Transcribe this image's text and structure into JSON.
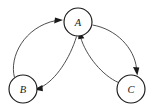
{
  "diagram": {
    "background_color": "#ffffff",
    "node_stroke_color": "#1a1a1a",
    "edge_stroke_color": "#3a3a3a",
    "label_color": "#1a1a1a",
    "nodes": [
      {
        "id": "A",
        "label": "A",
        "cx": 78,
        "cy": 22,
        "r": 14
      },
      {
        "id": "B",
        "label": "B",
        "cx": 23,
        "cy": 89,
        "r": 14
      },
      {
        "id": "C",
        "label": "C",
        "cx": 131,
        "cy": 89,
        "r": 14
      }
    ],
    "edges": [
      {
        "id": "B-to-A",
        "from": "B",
        "to": "A",
        "label": "",
        "shape": "outer-left-arc",
        "arrow_at": "A"
      },
      {
        "id": "A-to-B",
        "from": "A",
        "to": "B",
        "label": "",
        "shape": "inner-left-arc",
        "arrow_at": "B"
      },
      {
        "id": "A-to-C",
        "from": "A",
        "to": "C",
        "label": "",
        "shape": "outer-right-arc",
        "arrow_at": "C"
      },
      {
        "id": "C-to-A",
        "from": "C",
        "to": "A",
        "label": "",
        "shape": "inner-right-arc",
        "arrow_at": "A"
      }
    ]
  }
}
